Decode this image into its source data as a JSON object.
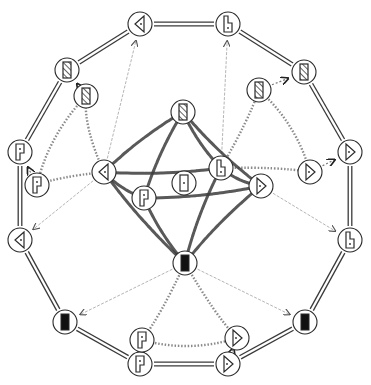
{
  "diagram": {
    "title": "",
    "node_radius": 12,
    "colors": {
      "stroke": "#2a2a2a",
      "double_edge": "#3a3a3a",
      "thick_edge": "#3c3c3c",
      "dotted_edge": "#8a8a8a",
      "arrow_edge": "#b5b5b5",
      "fill_black": "#111111",
      "background": "#ffffff"
    },
    "nodes": [
      {
        "id": "o1",
        "x": 140,
        "y": 24,
        "glyph": "triangle-left",
        "ring": "outer"
      },
      {
        "id": "o2",
        "x": 228,
        "y": 24,
        "glyph": "b-shape",
        "ring": "outer"
      },
      {
        "id": "o3",
        "x": 304,
        "y": 72,
        "glyph": "hatched-rect",
        "ring": "outer"
      },
      {
        "id": "o4",
        "x": 350,
        "y": 152,
        "glyph": "triangle-right",
        "ring": "outer"
      },
      {
        "id": "o5",
        "x": 350,
        "y": 240,
        "glyph": "b-shape",
        "ring": "outer"
      },
      {
        "id": "o6",
        "x": 305,
        "y": 322,
        "glyph": "black-rect",
        "ring": "outer"
      },
      {
        "id": "o7",
        "x": 228,
        "y": 364,
        "glyph": "triangle-right",
        "ring": "outer"
      },
      {
        "id": "o8",
        "x": 140,
        "y": 364,
        "glyph": "p-shape",
        "ring": "outer"
      },
      {
        "id": "o9",
        "x": 65,
        "y": 322,
        "glyph": "black-rect",
        "ring": "outer"
      },
      {
        "id": "o10",
        "x": 20,
        "y": 240,
        "glyph": "triangle-left",
        "ring": "outer"
      },
      {
        "id": "o11",
        "x": 20,
        "y": 152,
        "glyph": "p-shape",
        "ring": "outer"
      },
      {
        "id": "o12",
        "x": 67,
        "y": 70,
        "glyph": "hatched-rect",
        "ring": "outer"
      },
      {
        "id": "i1",
        "x": 86,
        "y": 96,
        "glyph": "hatched-rect",
        "ring": "inner"
      },
      {
        "id": "i2",
        "x": 37,
        "y": 185,
        "glyph": "p-shape",
        "ring": "inner"
      },
      {
        "id": "i3",
        "x": 259,
        "y": 90,
        "glyph": "hatched-rect",
        "ring": "inner"
      },
      {
        "id": "i4",
        "x": 310,
        "y": 172,
        "glyph": "triangle-right",
        "ring": "inner"
      },
      {
        "id": "i5",
        "x": 142,
        "y": 340,
        "glyph": "p-shape",
        "ring": "inner"
      },
      {
        "id": "i6",
        "x": 237,
        "y": 338,
        "glyph": "triangle-right",
        "ring": "inner"
      },
      {
        "id": "c1",
        "x": 183,
        "y": 112,
        "glyph": "hatched-rect",
        "ring": "center"
      },
      {
        "id": "c2",
        "x": 104,
        "y": 172,
        "glyph": "triangle-left",
        "ring": "center"
      },
      {
        "id": "c3",
        "x": 184,
        "y": 183,
        "glyph": "door-rect",
        "ring": "center"
      },
      {
        "id": "c4",
        "x": 221,
        "y": 168,
        "glyph": "b-shape",
        "ring": "center"
      },
      {
        "id": "c5",
        "x": 261,
        "y": 186,
        "glyph": "triangle-right",
        "ring": "center"
      },
      {
        "id": "c6",
        "x": 144,
        "y": 198,
        "glyph": "p-shape",
        "ring": "center"
      },
      {
        "id": "c7",
        "x": 185,
        "y": 263,
        "glyph": "black-rect",
        "ring": "center"
      }
    ],
    "double_edges": [
      [
        "o1",
        "o2"
      ],
      [
        "o2",
        "o3"
      ],
      [
        "o3",
        "o4"
      ],
      [
        "o4",
        "o5"
      ],
      [
        "o5",
        "o6"
      ],
      [
        "o6",
        "o7"
      ],
      [
        "o7",
        "o8"
      ],
      [
        "o8",
        "o9"
      ],
      [
        "o9",
        "o10"
      ],
      [
        "o10",
        "o11"
      ],
      [
        "o11",
        "o12"
      ],
      [
        "o12",
        "o1"
      ]
    ],
    "thick_edges": [
      [
        "c1",
        "c2"
      ],
      [
        "c1",
        "c6"
      ],
      [
        "c1",
        "c4"
      ],
      [
        "c1",
        "c5"
      ],
      [
        "c2",
        "c4"
      ],
      [
        "c2",
        "c6"
      ],
      [
        "c2",
        "c7"
      ],
      [
        "c6",
        "c7"
      ],
      [
        "c6",
        "c5"
      ],
      [
        "c4",
        "c5"
      ],
      [
        "c4",
        "c7"
      ],
      [
        "c5",
        "c7"
      ]
    ],
    "dotted_edges": [
      [
        "c2",
        "i1"
      ],
      [
        "c2",
        "i2"
      ],
      [
        "i1",
        "i2"
      ],
      [
        "c4",
        "i3"
      ],
      [
        "c4",
        "i4"
      ],
      [
        "i3",
        "i4"
      ],
      [
        "c7",
        "i5"
      ],
      [
        "c7",
        "i6"
      ],
      [
        "i5",
        "i6"
      ]
    ],
    "arrow_edges": [
      {
        "from": "c2",
        "to": "o1",
        "style": "faint"
      },
      {
        "from": "c2",
        "to": "o10",
        "style": "faint"
      },
      {
        "from": "c4",
        "to": "o2",
        "style": "faint"
      },
      {
        "from": "c5",
        "to": "o5",
        "style": "faint"
      },
      {
        "from": "c7",
        "to": "o9",
        "style": "faint"
      },
      {
        "from": "c7",
        "to": "o6",
        "style": "faint"
      },
      {
        "from": "i1",
        "to": "o12",
        "style": "short"
      },
      {
        "from": "i2",
        "to": "o11",
        "style": "short"
      },
      {
        "from": "i3",
        "to": "o3",
        "style": "short"
      },
      {
        "from": "i4",
        "to": "o4",
        "style": "short"
      },
      {
        "from": "i5",
        "to": "o8",
        "style": "short"
      },
      {
        "from": "i6",
        "to": "o7",
        "style": "short"
      }
    ]
  }
}
